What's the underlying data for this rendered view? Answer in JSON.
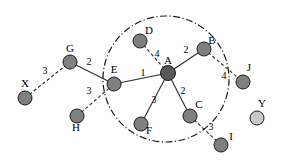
{
  "figure": {
    "width": 282,
    "height": 166,
    "background": "#ffffff"
  },
  "chart_data": {
    "type": "diagram",
    "subtype": "node-link-graph",
    "title": "",
    "nodes": [
      {
        "id": "A",
        "label": "A",
        "x": 168,
        "y": 73,
        "r": 7.5,
        "fill": "#595959",
        "label_dx": 0,
        "label_dy": -9,
        "in_cluster": true
      },
      {
        "id": "B",
        "label": "B",
        "x": 204,
        "y": 49,
        "r": 7.0,
        "fill": "#808080",
        "label_dx": 8,
        "label_dy": -5,
        "in_cluster": true
      },
      {
        "id": "C",
        "label": "C",
        "x": 190,
        "y": 116,
        "r": 7.0,
        "fill": "#808080",
        "label_dx": 9,
        "label_dy": -8,
        "in_cluster": true
      },
      {
        "id": "D",
        "label": "D",
        "x": 140,
        "y": 41,
        "r": 7.0,
        "fill": "#808080",
        "label_dx": 9,
        "label_dy": -7,
        "in_cluster": true
      },
      {
        "id": "E",
        "label": "E",
        "x": 114,
        "y": 84,
        "r": 7.0,
        "fill": "#808080",
        "label_dx": 0,
        "label_dy": -11,
        "in_cluster": true
      },
      {
        "id": "F",
        "label": "F",
        "x": 141,
        "y": 124,
        "r": 7.0,
        "fill": "#808080",
        "label_dx": 8,
        "label_dy": 10,
        "in_cluster": true
      },
      {
        "id": "G",
        "label": "G",
        "x": 70,
        "y": 62,
        "r": 7.0,
        "fill": "#808080",
        "label_dx": 0,
        "label_dy": -10,
        "in_cluster": false
      },
      {
        "id": "H",
        "label": "H",
        "x": 77,
        "y": 116,
        "r": 7.0,
        "fill": "#808080",
        "label_dx": -1,
        "label_dy": 15,
        "in_cluster": false
      },
      {
        "id": "I",
        "label": "I",
        "x": 221,
        "y": 145,
        "r": 7.0,
        "fill": "#808080",
        "label_dx": 10,
        "label_dy": -5,
        "in_cluster": false
      },
      {
        "id": "J",
        "label": "J",
        "x": 243,
        "y": 82,
        "r": 7.0,
        "fill": "#808080",
        "label_dx": 6,
        "label_dy": -11,
        "in_cluster": false
      },
      {
        "id": "X",
        "label": "X",
        "x": 25,
        "y": 98,
        "r": 7.0,
        "fill": "#808080",
        "label_dx": 0,
        "label_dy": -11,
        "in_cluster": false
      },
      {
        "id": "Y",
        "label": "Y",
        "x": 257,
        "y": 118,
        "r": 7.0,
        "fill": "#c8c8c8",
        "label_dx": 5,
        "label_dy": -11,
        "in_cluster": false
      }
    ],
    "edges": [
      {
        "source": "E",
        "target": "A",
        "weight": 1,
        "style": "solid",
        "label_x": 143,
        "label_y": 76
      },
      {
        "source": "A",
        "target": "B",
        "weight": 2,
        "style": "solid",
        "label_x": 186,
        "label_y": 53
      },
      {
        "source": "A",
        "target": "C",
        "weight": 2,
        "style": "solid",
        "label_x": 183,
        "label_y": 94
      },
      {
        "source": "A",
        "target": "F",
        "weight": 3,
        "style": "solid",
        "label_x": 154,
        "label_y": 103
      },
      {
        "source": "G",
        "target": "E",
        "weight": 2,
        "style": "solid",
        "label_x": 89,
        "label_y": 65
      },
      {
        "source": "D",
        "target": "A",
        "weight": 4,
        "style": "dashed",
        "label_x": 157,
        "label_y": 57
      },
      {
        "source": "X",
        "target": "G",
        "weight": 3,
        "style": "dashed",
        "label_x": 45,
        "label_y": 74
      },
      {
        "source": "H",
        "target": "E",
        "weight": 3,
        "style": "dashed",
        "label_x": 89,
        "label_y": 94
      },
      {
        "source": "B",
        "target": "J",
        "weight": 4,
        "style": "dashed",
        "label_x": 224,
        "label_y": 79
      },
      {
        "source": "C",
        "target": "I",
        "weight": 3,
        "style": "dashed",
        "label_x": 211,
        "label_y": 130
      }
    ],
    "cluster": {
      "label": "",
      "center_x": 166,
      "center_y": 79,
      "radius": 63,
      "style": "dash-dot",
      "members": [
        "A",
        "B",
        "C",
        "D",
        "E",
        "F"
      ]
    },
    "legend": {
      "visible": false,
      "entries": []
    },
    "axes": {
      "visible": false
    },
    "grid": false
  },
  "colors": {
    "node_default": "#808080",
    "node_center": "#595959",
    "node_outlier": "#c8c8c8",
    "edge": "#2b2b2b",
    "ring": "#1a1a1a",
    "text": "#000000",
    "background": "#ffffff"
  }
}
